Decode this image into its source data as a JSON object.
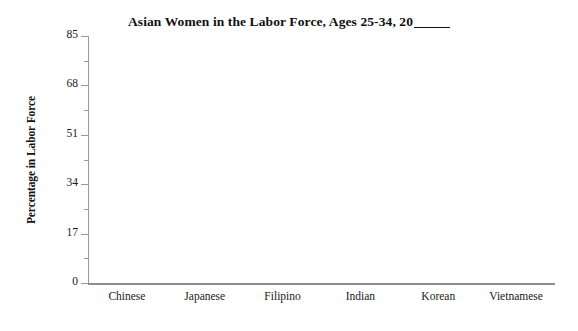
{
  "chart_data": {
    "type": "bar",
    "title_prefix": "Asian Women in the Labor Force, Ages 25-34, 20",
    "title_blank": "____",
    "xlabel": "",
    "ylabel": "Percentage in Labor Force",
    "categories": [
      "Chinese",
      "Japanese",
      "Filipino",
      "Indian",
      "Korean",
      "Vietnamese"
    ],
    "values": [
      null,
      null,
      null,
      null,
      null,
      null
    ],
    "ylim": [
      0,
      85
    ],
    "ytick_labels": [
      "0",
      "17",
      "34",
      "51",
      "68",
      "85"
    ],
    "ytick_values": [
      0,
      17,
      34,
      51,
      68,
      85
    ],
    "yminor_values": [
      8.5,
      25.5,
      42.5,
      59.5,
      76.5
    ],
    "grid": false,
    "legend": false,
    "note": "blank chart template - no data plotted"
  },
  "style": {
    "axis_color": "#9a9a9a",
    "text_color": "#1a1a1a",
    "background": "#ffffff"
  }
}
